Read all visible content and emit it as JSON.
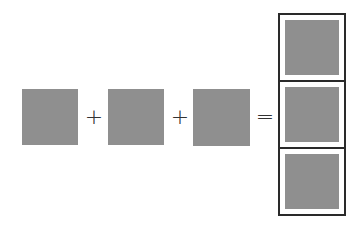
{
  "diagram": {
    "type": "equation",
    "terms": [
      {
        "shape": "square",
        "color": "#8f8f8f"
      },
      {
        "shape": "square",
        "color": "#8f8f8f"
      },
      {
        "shape": "square",
        "color": "#8f8f8f"
      }
    ],
    "operators": [
      "+",
      "+",
      "="
    ],
    "result": {
      "shape": "vertical-stack",
      "cells": 3,
      "cell_color": "#8f8f8f",
      "border_color": "#2a2a2a"
    }
  }
}
